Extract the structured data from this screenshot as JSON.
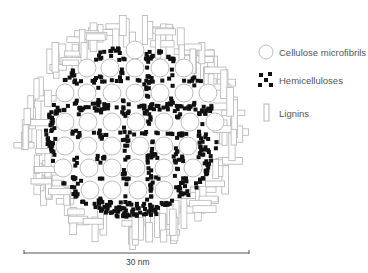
{
  "diagram": {
    "type": "cross-section schematic",
    "center": [
      132,
      132
    ],
    "outer_radius": 117,
    "inner_radius": 86,
    "colors": {
      "cellulose_stroke": "#bdbdbd",
      "hemicellulose_fill": "#111111",
      "lignin_stroke": "#b5b5b5",
      "scale_bar": "#555555"
    },
    "cellulose_microfibrils": [
      [
        135,
        50
      ],
      [
        87,
        68
      ],
      [
        110,
        68
      ],
      [
        135,
        68
      ],
      [
        160,
        68
      ],
      [
        184,
        68
      ],
      [
        65,
        93
      ],
      [
        87,
        93
      ],
      [
        112,
        93
      ],
      [
        135,
        93
      ],
      [
        160,
        93
      ],
      [
        184,
        93
      ],
      [
        208,
        93
      ],
      [
        65,
        122
      ],
      [
        88,
        122
      ],
      [
        112,
        122
      ],
      [
        136,
        122
      ],
      [
        164,
        122
      ],
      [
        190,
        122
      ],
      [
        215,
        122
      ],
      [
        65,
        146
      ],
      [
        88,
        146
      ],
      [
        112,
        146
      ],
      [
        140,
        146
      ],
      [
        164,
        146
      ],
      [
        188,
        146
      ],
      [
        63,
        168
      ],
      [
        89,
        168
      ],
      [
        112,
        168
      ],
      [
        136,
        168
      ],
      [
        164,
        168
      ],
      [
        193,
        168
      ],
      [
        90,
        190
      ],
      [
        112,
        190
      ],
      [
        138,
        190
      ],
      [
        164,
        190
      ]
    ],
    "microfibril_radius": 9,
    "hemicellulose_count": 520,
    "hemicellulose_size": 4,
    "lignin_count": 150
  },
  "legend": {
    "items": [
      {
        "key": "cellulose",
        "label": "Cellulose microfibrils"
      },
      {
        "key": "hemicellulose",
        "label": "Hemicelluloses"
      },
      {
        "key": "lignin",
        "label": "Lignins"
      }
    ]
  },
  "scale_bar": {
    "label": "30 nm",
    "x1": 24,
    "x2": 249,
    "y": 253
  }
}
